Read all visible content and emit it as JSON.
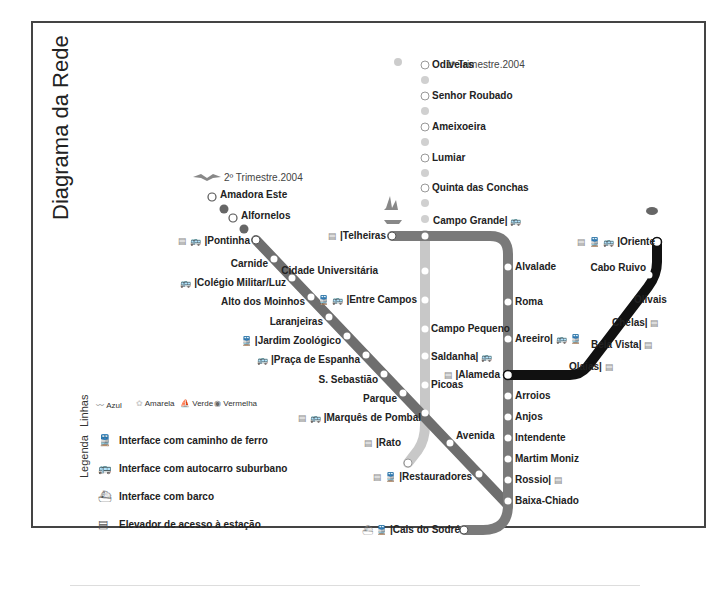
{
  "title": "Diagrama da Rede",
  "notes": {
    "yellow_extension": "1º Trimestre.2004",
    "blue_extension": "2º Trimestre.2004"
  },
  "colors": {
    "blue_line": "#6e6e6e",
    "yellow_line": "#c8c8c8",
    "green_line": "#7a7a7a",
    "red_line": "#111111",
    "frame": "#444444"
  },
  "lines": {
    "blue": {
      "name": "Azul",
      "stations": [
        {
          "name": "Amadora Este",
          "future": true
        },
        {
          "name": "Alfornelos",
          "future": true
        },
        {
          "name": "Pontinha",
          "icons": [
            "elevator-icon",
            "bus-icon"
          ]
        },
        {
          "name": "Carnide"
        },
        {
          "name": "Colégio Militar/Luz",
          "icons": [
            "bus-icon"
          ]
        },
        {
          "name": "Alto dos Moinhos"
        },
        {
          "name": "Laranjeiras"
        },
        {
          "name": "Jardim Zoológico",
          "icons": [
            "train-icon"
          ]
        },
        {
          "name": "Praça de Espanha",
          "icons": [
            "bus-icon"
          ]
        },
        {
          "name": "S. Sebastião"
        },
        {
          "name": "Parque"
        },
        {
          "name": "Marquês de Pombal",
          "icons": [
            "elevator-icon",
            "bus-icon"
          ]
        },
        {
          "name": "Avenida"
        },
        {
          "name": "Restauradores",
          "icons": [
            "elevator-icon",
            "train-icon"
          ]
        },
        {
          "name": "Baixa-Chiado"
        }
      ]
    },
    "yellow": {
      "name": "Amarela",
      "stations": [
        {
          "name": "Odivelas",
          "future": true
        },
        {
          "name": "Senhor Roubado",
          "future": true
        },
        {
          "name": "Ameixoeira",
          "future": true
        },
        {
          "name": "Lumiar",
          "future": true
        },
        {
          "name": "Quinta das Conchas",
          "future": true
        },
        {
          "name": "Campo Grande",
          "icons": [
            "bus-icon"
          ]
        },
        {
          "name": "Cidade Universitária"
        },
        {
          "name": "Entre Campos",
          "icons": [
            "train-icon",
            "bus-icon"
          ]
        },
        {
          "name": "Campo Pequeno"
        },
        {
          "name": "Saldanha",
          "icons": [
            "bus-icon"
          ]
        },
        {
          "name": "Picoas"
        },
        {
          "name": "Marquês de Pombal"
        },
        {
          "name": "Rato",
          "icons": [
            "elevator-icon"
          ]
        }
      ]
    },
    "green": {
      "name": "Verde",
      "stations": [
        {
          "name": "Telheiras",
          "icons": [
            "elevator-icon"
          ]
        },
        {
          "name": "Campo Grande"
        },
        {
          "name": "Alvalade"
        },
        {
          "name": "Roma"
        },
        {
          "name": "Areeiro",
          "icons": [
            "bus-icon",
            "train-icon"
          ]
        },
        {
          "name": "Alameda",
          "icons": [
            "elevator-icon"
          ]
        },
        {
          "name": "Arroios"
        },
        {
          "name": "Anjos"
        },
        {
          "name": "Intendente"
        },
        {
          "name": "Martim Moniz"
        },
        {
          "name": "Rossio",
          "icons": [
            "elevator-icon"
          ]
        },
        {
          "name": "Baixa-Chiado"
        },
        {
          "name": "Cais do Sodré",
          "icons": [
            "boat-icon",
            "train-icon"
          ]
        }
      ]
    },
    "red": {
      "name": "Vermelha",
      "stations": [
        {
          "name": "Alameda"
        },
        {
          "name": "Olaias",
          "icons": [
            "elevator-icon"
          ]
        },
        {
          "name": "Bela Vista",
          "icons": [
            "elevator-icon"
          ]
        },
        {
          "name": "Chelas",
          "icons": [
            "elevator-icon"
          ]
        },
        {
          "name": "Olivais"
        },
        {
          "name": "Cabo Ruivo"
        },
        {
          "name": "Oriente",
          "icons": [
            "elevator-icon",
            "train-icon",
            "bus-icon"
          ]
        }
      ]
    }
  },
  "legend": {
    "title": "Legenda",
    "lines_title": "Linhas",
    "line_prefix": "linha",
    "line_names": [
      "Azul",
      "Amarela",
      "Verde",
      "Vermelha"
    ],
    "items": [
      {
        "icon": "train-icon",
        "label": "Interface com caminho de ferro"
      },
      {
        "icon": "bus-icon",
        "label": "Interface com autocarro suburbano"
      },
      {
        "icon": "boat-icon",
        "label": "Interface com barco"
      },
      {
        "icon": "elevator-icon",
        "label": "Elevador de acesso à estação"
      }
    ]
  },
  "labels": {
    "amadora_este": "Amadora Este",
    "alfornelos": "Alfornelos",
    "pontinha": "Pontinha",
    "carnide": "Carnide",
    "colegio": "Colégio Militar/Luz",
    "alto": "Alto dos Moinhos",
    "laranjeiras": "Laranjeiras",
    "jardim": "Jardim Zoológico",
    "praca": "Praça de Espanha",
    "sebastiao": "S. Sebastião",
    "parque": "Parque",
    "marques": "Marquês de Pombal",
    "avenida": "Avenida",
    "restauradores": "Restauradores",
    "baixa": "Baixa-Chiado",
    "odivelas": "Odivelas",
    "senhor": "Senhor Roubado",
    "ameixoeira": "Ameixoeira",
    "lumiar": "Lumiar",
    "quinta": "Quinta das Conchas",
    "campo_grande": "Campo Grande",
    "cidade": "Cidade Universitária",
    "entre": "Entre Campos",
    "campo_pequeno": "Campo Pequeno",
    "saldanha": "Saldanha",
    "picoas": "Picoas",
    "rato": "Rato",
    "telheiras": "Telheiras",
    "alvalade": "Alvalade",
    "roma": "Roma",
    "areeiro": "Areeiro",
    "alameda": "Alameda",
    "arroios": "Arroios",
    "anjos": "Anjos",
    "intendente": "Intendente",
    "martim": "Martim Moniz",
    "rossio": "Rossio",
    "cais": "Cais do Sodré",
    "olaias": "Olaias",
    "bela_vista": "Bela Vista",
    "chelas": "Chelas",
    "olivais": "Olivais",
    "cabo_ruivo": "Cabo Ruivo",
    "oriente": "Oriente"
  },
  "icons": {
    "train": "🚆",
    "bus": "🚌",
    "boat": "⛴",
    "elevator": "▤",
    "sep": "|"
  }
}
